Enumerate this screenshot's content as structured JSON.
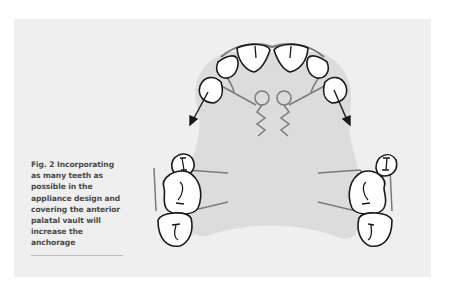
{
  "figure": {
    "label": "Fig. 2",
    "caption_lines": [
      "Fig. 2 Incorporating",
      "as many teeth as",
      "possible in the",
      "appliance design and",
      "covering the anterior",
      "palatal vault will",
      "increase the",
      "anchorage"
    ],
    "colors": {
      "panel_background": "#efefef",
      "palate_fill": "#dcdcdc",
      "tooth_fill": "#ffffff",
      "tooth_outline": "#1a1a1a",
      "wire": "#7a7a7a",
      "caption_text": "#4a4a4a"
    }
  }
}
